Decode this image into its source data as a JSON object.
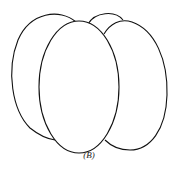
{
  "figure": {
    "caption": "(B)",
    "stroke_color": "#111111",
    "fill_color": "#ffffff"
  }
}
